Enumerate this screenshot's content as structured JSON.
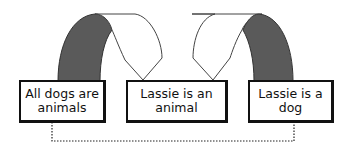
{
  "diagram": {
    "type": "syllogism-link-diagram",
    "boxes": [
      {
        "id": "premise-major",
        "text": "All dogs are\nanimals"
      },
      {
        "id": "conclusion",
        "text": "Lassie is an\nanimal"
      },
      {
        "id": "premise-minor",
        "text": "Lassie is a\ndog"
      }
    ],
    "connectors": [
      {
        "from": "premise-major",
        "to": "conclusion",
        "style": "arch",
        "fill_left": "#5a5a5a",
        "fill_right": "#ffffff"
      },
      {
        "from": "premise-minor",
        "to": "conclusion",
        "style": "arch",
        "fill_left": "#ffffff",
        "fill_right": "#5a5a5a"
      },
      {
        "from": "premise-major",
        "to": "premise-minor",
        "style": "dotted"
      }
    ],
    "colors": {
      "stroke": "#111111",
      "arch_dark": "#5a5a5a",
      "background": "#ffffff"
    }
  }
}
